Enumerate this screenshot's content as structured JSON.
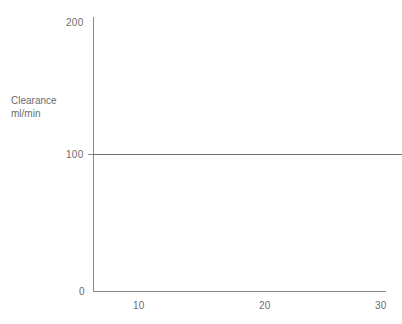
{
  "chart_data": {
    "type": "line",
    "title": "",
    "subtitle": "",
    "xlabel": "",
    "ylabel": "Clearance ml/min",
    "ylabel_lines": [
      "Clearance",
      "ml/min"
    ],
    "x": [
      0,
      30
    ],
    "series": [
      {
        "name": "Clearance",
        "values": [
          100,
          100
        ],
        "color": "#6f6f6f",
        "note": "flat horizontal line at y = 100 ml/min spanning the full plot width"
      }
    ],
    "xlim": [
      0,
      30
    ],
    "ylim": [
      0,
      200
    ],
    "xticks": [
      10,
      20,
      30
    ],
    "xtick_labels": [
      "10",
      "20",
      "30"
    ],
    "yticks": [
      0,
      100,
      200
    ],
    "ytick_labels": [
      "0",
      "100",
      "200"
    ],
    "grid": false,
    "legend": false,
    "legend_position": "none",
    "axis_color": "#8a8a8a",
    "text_color": "#6b6b6b",
    "background": "#ffffff"
  },
  "axes": {
    "y_title_line1": "Clearance",
    "y_title_line2": "ml/min",
    "y_labels": {
      "top": "200",
      "mid": "100",
      "origin": "0"
    },
    "x_labels": {
      "t10": "10",
      "t20": "20",
      "t30": "30"
    }
  }
}
